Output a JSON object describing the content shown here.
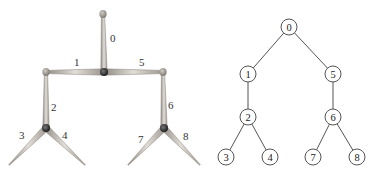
{
  "figure": {
    "left_panel": {
      "type": "skeleton-3d-rendering",
      "joints": [
        {
          "id": "root-knob",
          "x": 103,
          "y": 14,
          "kind": "end"
        },
        {
          "id": "center",
          "x": 104,
          "y": 72,
          "kind": "joint"
        },
        {
          "id": "left-knob",
          "x": 46,
          "y": 72,
          "kind": "end"
        },
        {
          "id": "right-knob",
          "x": 163,
          "y": 72,
          "kind": "end"
        },
        {
          "id": "left-hub",
          "x": 46,
          "y": 128,
          "kind": "joint"
        },
        {
          "id": "right-hub",
          "x": 164,
          "y": 128,
          "kind": "joint"
        },
        {
          "id": "end-3",
          "x": 9,
          "y": 165,
          "kind": "tip"
        },
        {
          "id": "end-4",
          "x": 85,
          "y": 165,
          "kind": "tip"
        },
        {
          "id": "end-7",
          "x": 128,
          "y": 165,
          "kind": "tip"
        },
        {
          "id": "end-8",
          "x": 200,
          "y": 165,
          "kind": "tip"
        }
      ],
      "bones": [
        {
          "label": "0",
          "from": "center",
          "to": "root-knob",
          "label_x": 110,
          "label_y": 42
        },
        {
          "label": "1",
          "from": "center",
          "to": "left-knob",
          "label_x": 74,
          "label_y": 66
        },
        {
          "label": "5",
          "from": "center",
          "to": "right-knob",
          "label_x": 139,
          "label_y": 66
        },
        {
          "label": "2",
          "from": "left-hub",
          "to": "left-knob",
          "label_x": 51,
          "label_y": 111
        },
        {
          "label": "6",
          "from": "right-hub",
          "to": "right-knob",
          "label_x": 168,
          "label_y": 109
        },
        {
          "label": "3",
          "from": "left-hub",
          "to": "end-3",
          "label_x": 19,
          "label_y": 139
        },
        {
          "label": "4",
          "from": "left-hub",
          "to": "end-4",
          "label_x": 62,
          "label_y": 139
        },
        {
          "label": "7",
          "from": "right-hub",
          "to": "end-7",
          "label_x": 138,
          "label_y": 143
        },
        {
          "label": "8",
          "from": "right-hub",
          "to": "end-8",
          "label_x": 183,
          "label_y": 140
        }
      ],
      "colors": {
        "bone_light": "#d8d2ca",
        "bone_dark": "#8f8a84",
        "joint": "#3a3a3a",
        "knob": "#a8a29b"
      }
    },
    "right_panel": {
      "type": "tree-graph",
      "nodes": [
        {
          "label": "0",
          "x": 289,
          "y": 27
        },
        {
          "label": "1",
          "x": 248,
          "y": 74
        },
        {
          "label": "5",
          "x": 333,
          "y": 74
        },
        {
          "label": "2",
          "x": 248,
          "y": 117
        },
        {
          "label": "6",
          "x": 333,
          "y": 117
        },
        {
          "label": "3",
          "x": 226,
          "y": 157
        },
        {
          "label": "4",
          "x": 270,
          "y": 157
        },
        {
          "label": "7",
          "x": 313,
          "y": 157
        },
        {
          "label": "8",
          "x": 357,
          "y": 157
        }
      ],
      "edges": [
        [
          "0",
          "1"
        ],
        [
          "0",
          "5"
        ],
        [
          "1",
          "2"
        ],
        [
          "5",
          "6"
        ],
        [
          "2",
          "3"
        ],
        [
          "2",
          "4"
        ],
        [
          "6",
          "7"
        ],
        [
          "6",
          "8"
        ]
      ],
      "node_radius": 8
    }
  }
}
